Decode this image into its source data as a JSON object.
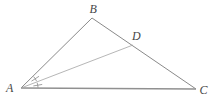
{
  "diagram": {
    "type": "geometry-triangle-with-angle-bisector",
    "labels": {
      "vertex_a": "A",
      "vertex_b": "B",
      "vertex_c": "C",
      "point_d": "D"
    },
    "colors": {
      "side": "#8a8a8a",
      "base": "#909090",
      "cevian": "#a3a3a3",
      "angle_mark": "#8a8a8a",
      "label": "#474747",
      "background": "#ffffff"
    }
  }
}
